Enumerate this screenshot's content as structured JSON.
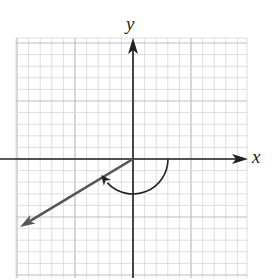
{
  "figure": {
    "type": "coordinate-plane-angle",
    "axes": {
      "x_label": "x",
      "y_label": "y"
    },
    "grid": {
      "left": 16,
      "top": 38,
      "right": 247,
      "bottom": 278,
      "cell": 11.6,
      "minor_color": "#d6d6d6",
      "major_color": "#bdbdbd",
      "major_every": 5
    },
    "origin": {
      "x": 133,
      "y": 159
    },
    "terminal_ray": {
      "end": {
        "x": 20,
        "y": 227
      },
      "color": "#555555",
      "approx_angle_deg": -149
    },
    "rotation_arc": {
      "radius": 35,
      "direction": "clockwise",
      "start_deg": 0,
      "end_deg": -149,
      "color": "#222222"
    },
    "colors": {
      "axis": "#222222",
      "background": "#ffffff"
    }
  }
}
